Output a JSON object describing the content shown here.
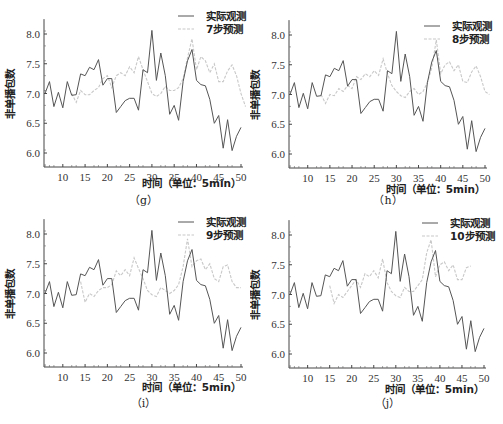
{
  "shared": {
    "ylabel": "非单播包数",
    "xlabel": "时间（单位：5min）",
    "legend_observed": "实际观测",
    "observed_color": "#555555",
    "predicted_color": "#c8c8c8",
    "yticks": [
      "6.0",
      "6.5",
      "7.0",
      "7.5",
      "8.0"
    ],
    "xticks": [
      "10",
      "15",
      "20",
      "25",
      "30",
      "35",
      "40",
      "45",
      "50"
    ]
  },
  "panels": [
    {
      "caption": "（g）",
      "legend_predicted": "7步预测"
    },
    {
      "caption": "（h）",
      "legend_predicted": "8步预测"
    },
    {
      "caption": "（i）",
      "legend_predicted": "9步预测"
    },
    {
      "caption": "（j）",
      "legend_predicted": "10步预测"
    }
  ],
  "chart_data": [
    {
      "type": "line",
      "title": "(g)",
      "xlabel": "时间（单位：5min）",
      "ylabel": "非单播包数",
      "xlim": [
        6,
        50
      ],
      "ylim": [
        5.8,
        8.25
      ],
      "grid": false,
      "legend_position": "top-right",
      "x": [
        6,
        7,
        8,
        9,
        10,
        11,
        12,
        13,
        14,
        15,
        16,
        17,
        18,
        19,
        20,
        21,
        22,
        23,
        24,
        25,
        26,
        27,
        28,
        29,
        30,
        31,
        32,
        33,
        34,
        35,
        36,
        37,
        38,
        39,
        40,
        41,
        42,
        43,
        44,
        45,
        46,
        47,
        48,
        49,
        50
      ],
      "series": [
        {
          "name": "实际观测",
          "values": [
            7.0,
            7.2,
            6.78,
            7.02,
            6.76,
            7.2,
            6.97,
            6.98,
            7.33,
            7.3,
            7.44,
            7.4,
            7.57,
            7.14,
            7.25,
            7.25,
            6.68,
            6.78,
            6.88,
            6.92,
            6.92,
            6.72,
            7.4,
            7.35,
            8.06,
            7.22,
            7.68,
            7.3,
            6.65,
            6.8,
            6.55,
            7.2,
            7.55,
            7.74,
            7.22,
            7.15,
            7.13,
            6.9,
            6.5,
            6.63,
            6.08,
            6.56,
            6.04,
            6.28,
            6.43
          ]
        },
        {
          "name": "7步预测",
          "x_start": 12,
          "values": [
            7.0,
            6.85,
            7.05,
            6.98,
            6.98,
            7.05,
            7.1,
            7.25,
            7.3,
            7.1,
            7.3,
            7.35,
            7.3,
            7.45,
            7.35,
            7.62,
            7.4,
            7.2,
            7.0,
            6.95,
            7.0,
            7.12,
            7.05,
            7.05,
            7.1,
            7.25,
            7.6,
            7.92,
            7.4,
            7.62,
            7.55,
            7.35,
            7.5,
            7.2,
            7.2,
            7.38,
            7.48,
            7.3,
            7.0,
            6.78
          ]
        }
      ]
    },
    {
      "type": "line",
      "title": "(h)",
      "xlabel": "时间（单位：5min）",
      "ylabel": "非单播包数",
      "xlim": [
        6,
        50
      ],
      "ylim": [
        5.8,
        8.25
      ],
      "grid": false,
      "legend_position": "top-right",
      "x": [
        6,
        7,
        8,
        9,
        10,
        11,
        12,
        13,
        14,
        15,
        16,
        17,
        18,
        19,
        20,
        21,
        22,
        23,
        24,
        25,
        26,
        27,
        28,
        29,
        30,
        31,
        32,
        33,
        34,
        35,
        36,
        37,
        38,
        39,
        40,
        41,
        42,
        43,
        44,
        45,
        46,
        47,
        48,
        49,
        50
      ],
      "series": [
        {
          "name": "实际观测",
          "values": [
            7.0,
            7.2,
            6.78,
            7.02,
            6.76,
            7.2,
            6.97,
            6.98,
            7.33,
            7.3,
            7.44,
            7.4,
            7.57,
            7.14,
            7.25,
            7.25,
            6.68,
            6.78,
            6.88,
            6.92,
            6.92,
            6.72,
            7.4,
            7.35,
            8.06,
            7.22,
            7.68,
            7.3,
            6.65,
            6.8,
            6.55,
            7.2,
            7.55,
            7.74,
            7.22,
            7.15,
            7.13,
            6.9,
            6.5,
            6.63,
            6.08,
            6.56,
            6.04,
            6.28,
            6.43
          ]
        },
        {
          "name": "8步预测",
          "x_start": 13,
          "values": [
            7.0,
            6.85,
            7.0,
            6.98,
            7.1,
            7.05,
            7.15,
            7.1,
            7.3,
            7.25,
            7.35,
            7.3,
            7.4,
            7.32,
            7.6,
            7.35,
            7.15,
            7.05,
            6.98,
            6.95,
            7.05,
            7.1,
            7.0,
            7.05,
            7.2,
            7.45,
            7.92,
            7.35,
            7.5,
            7.55,
            7.4,
            7.5,
            7.22,
            7.2,
            7.38,
            7.48,
            7.3,
            7.05,
            7.0
          ]
        }
      ]
    },
    {
      "type": "line",
      "title": "(i)",
      "xlabel": "时间（单位：5min）",
      "ylabel": "非单播包数",
      "xlim": [
        6,
        50
      ],
      "ylim": [
        5.8,
        8.25
      ],
      "grid": false,
      "legend_position": "top-right",
      "x": [
        6,
        7,
        8,
        9,
        10,
        11,
        12,
        13,
        14,
        15,
        16,
        17,
        18,
        19,
        20,
        21,
        22,
        23,
        24,
        25,
        26,
        27,
        28,
        29,
        30,
        31,
        32,
        33,
        34,
        35,
        36,
        37,
        38,
        39,
        40,
        41,
        42,
        43,
        44,
        45,
        46,
        47,
        48,
        49,
        50
      ],
      "series": [
        {
          "name": "实际观测",
          "values": [
            7.0,
            7.2,
            6.78,
            7.02,
            6.76,
            7.2,
            6.97,
            6.98,
            7.33,
            7.3,
            7.44,
            7.4,
            7.57,
            7.14,
            7.25,
            7.25,
            6.68,
            6.78,
            6.88,
            6.92,
            6.92,
            6.72,
            7.4,
            7.35,
            8.06,
            7.22,
            7.68,
            7.3,
            6.65,
            6.8,
            6.55,
            7.2,
            7.55,
            7.74,
            7.22,
            7.15,
            7.13,
            6.9,
            6.5,
            6.63,
            6.08,
            6.56,
            6.04,
            6.28,
            6.43
          ]
        },
        {
          "name": "9步预测",
          "x_start": 14,
          "values": [
            7.2,
            6.85,
            7.0,
            6.95,
            7.05,
            7.1,
            7.1,
            7.15,
            7.38,
            7.3,
            7.4,
            7.3,
            7.6,
            7.42,
            7.25,
            7.05,
            6.98,
            6.95,
            7.1,
            7.05,
            7.0,
            7.05,
            7.15,
            7.45,
            7.92,
            7.45,
            7.55,
            7.58,
            7.4,
            7.5,
            7.25,
            7.2,
            7.45,
            7.48,
            7.2,
            7.1,
            7.1
          ]
        }
      ]
    },
    {
      "type": "line",
      "title": "(j)",
      "xlabel": "时间（单位：5min）",
      "ylabel": "非单播包数",
      "xlim": [
        6,
        50
      ],
      "ylim": [
        5.8,
        8.25
      ],
      "grid": false,
      "legend_position": "top-right",
      "x": [
        6,
        7,
        8,
        9,
        10,
        11,
        12,
        13,
        14,
        15,
        16,
        17,
        18,
        19,
        20,
        21,
        22,
        23,
        24,
        25,
        26,
        27,
        28,
        29,
        30,
        31,
        32,
        33,
        34,
        35,
        36,
        37,
        38,
        39,
        40,
        41,
        42,
        43,
        44,
        45,
        46,
        47,
        48,
        49,
        50
      ],
      "series": [
        {
          "name": "实际观测",
          "values": [
            7.0,
            7.2,
            6.78,
            7.02,
            6.76,
            7.2,
            6.97,
            6.98,
            7.33,
            7.3,
            7.44,
            7.4,
            7.57,
            7.14,
            7.25,
            7.25,
            6.68,
            6.78,
            6.88,
            6.92,
            6.92,
            6.72,
            7.4,
            7.35,
            8.06,
            7.22,
            7.68,
            7.3,
            6.65,
            6.8,
            6.55,
            7.2,
            7.55,
            7.74,
            7.22,
            7.15,
            7.13,
            6.9,
            6.5,
            6.63,
            6.08,
            6.56,
            6.04,
            6.28,
            6.43
          ]
        },
        {
          "name": "10步预测",
          "x_start": 15,
          "values": [
            7.15,
            6.85,
            7.0,
            6.95,
            7.05,
            7.15,
            7.25,
            7.12,
            7.35,
            7.3,
            7.4,
            7.28,
            7.6,
            7.2,
            7.05,
            6.98,
            6.95,
            7.12,
            7.05,
            7.05,
            7.15,
            7.25,
            7.7,
            7.92,
            7.3,
            7.5,
            7.55,
            7.4,
            7.5,
            7.25,
            7.25,
            7.45,
            7.48
          ]
        }
      ]
    }
  ]
}
